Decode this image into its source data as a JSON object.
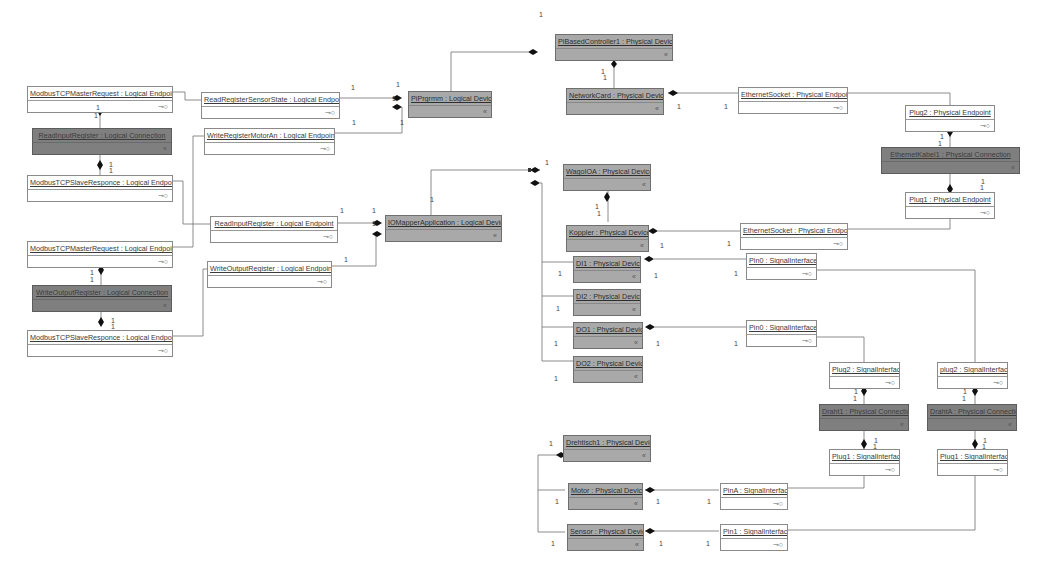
{
  "diagram": {
    "nodes": [
      {
        "id": "mtcp_req1",
        "label": "ModbusTCPMasterRequest : Logical Endpoint",
        "kind": "endpoint",
        "port": "⊸○"
      },
      {
        "id": "conn_read",
        "label": "ReadInputRegister : Logical Connection",
        "kind": "connection",
        "port": "«"
      },
      {
        "id": "mtcp_resp1",
        "label": "ModbusTCPSlaveResponce : Logical Endpoint",
        "kind": "endpoint",
        "port": "⊸○"
      },
      {
        "id": "mtcp_req2",
        "label": "ModbusTCPMasterRequest : Logical Endpoint",
        "kind": "endpoint",
        "port": "⊸○"
      },
      {
        "id": "conn_write",
        "label": "WriteOutputRegister : Logical Connection",
        "kind": "connection",
        "port": "«"
      },
      {
        "id": "mtcp_resp2",
        "label": "ModbusTCPSlaveResponce : Logical Endpoint",
        "kind": "endpoint",
        "port": "⊸○"
      },
      {
        "id": "rrss",
        "label": "ReadRegisterSensorState : Logical Endpoint",
        "kind": "endpoint",
        "port": "⊸○"
      },
      {
        "id": "wrma",
        "label": "WriteRegisterMotorAn : Logical Endpoint",
        "kind": "endpoint",
        "port": "⊸○"
      },
      {
        "id": "rir",
        "label": "ReadInputRegister : Logical Endpoint",
        "kind": "endpoint",
        "port": "⊸○"
      },
      {
        "id": "wor",
        "label": "WriteOutputRegister : Logical Endpoint",
        "kind": "endpoint",
        "port": "⊸○"
      },
      {
        "id": "piprog",
        "label": "PiPrgrmm : Logical Device",
        "kind": "device",
        "port": "«"
      },
      {
        "id": "iomapper",
        "label": "IOMapperApplication : Logical Device",
        "kind": "device",
        "port": "«"
      },
      {
        "id": "pibased",
        "label": "PiBasedController1 : Physical Device",
        "kind": "device",
        "port": "«"
      },
      {
        "id": "netcard",
        "label": "NetworkCard : Physical Device",
        "kind": "device",
        "port": "«"
      },
      {
        "id": "ethsock1",
        "label": "EthernetSocket : Physical Endpoint",
        "kind": "endpoint",
        "port": "⊸○"
      },
      {
        "id": "plug2pe",
        "label": "Plug2 : Physical Endpoint",
        "kind": "endpoint",
        "port": "⊸○"
      },
      {
        "id": "ethkabel",
        "label": "EthernetKabel1 : Physical Connection",
        "kind": "connection",
        "port": "«"
      },
      {
        "id": "plug1pe",
        "label": "Plug1 : Physical Endpoint",
        "kind": "endpoint",
        "port": "⊸○"
      },
      {
        "id": "wago",
        "label": "WagoIOA : Physical Device",
        "kind": "device",
        "port": "«"
      },
      {
        "id": "koppler",
        "label": "Koppler : Physical Device",
        "kind": "device",
        "port": "«"
      },
      {
        "id": "ethsock2",
        "label": "EthernetSocket : Physical Endpoint",
        "kind": "endpoint",
        "port": "⊸○"
      },
      {
        "id": "di1",
        "label": "DI1 : Physical Device",
        "kind": "device",
        "port": "«"
      },
      {
        "id": "di2",
        "label": "DI2 : Physical Device",
        "kind": "device",
        "port": "«"
      },
      {
        "id": "do1",
        "label": "DO1 : Physical Device",
        "kind": "device",
        "port": "«"
      },
      {
        "id": "do2",
        "label": "DO2 : Physical Device",
        "kind": "device",
        "port": "«"
      },
      {
        "id": "pin0a",
        "label": "Pin0 : SignalInterface",
        "kind": "endpoint",
        "port": "⊸○"
      },
      {
        "id": "pin0b",
        "label": "Pin0 : SignalInterface",
        "kind": "endpoint",
        "port": "⊸○"
      },
      {
        "id": "plug2si_a",
        "label": "Plug2 : SignalInterface",
        "kind": "endpoint",
        "port": "⊸○"
      },
      {
        "id": "draht1",
        "label": "Draht1 : Physical Connection",
        "kind": "connection",
        "port": "«"
      },
      {
        "id": "plug1si_a",
        "label": "Plug1 : SignalInterface",
        "kind": "endpoint",
        "port": "⊸○"
      },
      {
        "id": "plug2si_b",
        "label": "plug2 : SignalInterface",
        "kind": "endpoint",
        "port": "⊸○"
      },
      {
        "id": "drahtA",
        "label": "DrahtA : Physical Connection",
        "kind": "connection",
        "port": "«"
      },
      {
        "id": "plug1si_b",
        "label": "Plug1 : SignalInterface",
        "kind": "endpoint",
        "port": "⊸○"
      },
      {
        "id": "drehtisch",
        "label": "Drehtisch1 : Physical Device",
        "kind": "device",
        "port": "«"
      },
      {
        "id": "motor",
        "label": "Motor : Physical Device",
        "kind": "device",
        "port": "«"
      },
      {
        "id": "sensor",
        "label": "Sensor : Physical Device",
        "kind": "device",
        "port": "«"
      },
      {
        "id": "pinA",
        "label": "PinA : SignalInterface",
        "kind": "endpoint",
        "port": "⊸○"
      },
      {
        "id": "pin1",
        "label": "Pin1 : SignalInterface",
        "kind": "endpoint",
        "port": "⊸○"
      }
    ],
    "multiplicities": [
      {
        "text": "1",
        "x": 96,
        "y": 104
      },
      {
        "text": "1",
        "x": 94,
        "y": 112
      },
      {
        "text": "1",
        "x": 109,
        "y": 161
      },
      {
        "text": "1",
        "x": 109,
        "y": 167
      },
      {
        "text": "1",
        "x": 90,
        "y": 269
      },
      {
        "text": "1",
        "x": 90,
        "y": 276
      },
      {
        "text": "1",
        "x": 111,
        "y": 317
      },
      {
        "text": "1",
        "x": 111,
        "y": 323
      },
      {
        "text": "1",
        "x": 351,
        "y": 84
      },
      {
        "text": "1",
        "x": 396,
        "y": 81
      },
      {
        "text": "1",
        "x": 392,
        "y": 95
      },
      {
        "text": "1",
        "x": 352,
        "y": 119
      },
      {
        "text": "1",
        "x": 400,
        "y": 119
      },
      {
        "text": "1",
        "x": 539,
        "y": 11
      },
      {
        "text": "1",
        "x": 601,
        "y": 68
      },
      {
        "text": "1",
        "x": 603,
        "y": 74
      },
      {
        "text": "1",
        "x": 677,
        "y": 103
      },
      {
        "text": "1",
        "x": 724,
        "y": 103
      },
      {
        "text": "1",
        "x": 940,
        "y": 133
      },
      {
        "text": "1",
        "x": 938,
        "y": 140
      },
      {
        "text": "1",
        "x": 981,
        "y": 178
      },
      {
        "text": "1",
        "x": 980,
        "y": 184
      },
      {
        "text": "1",
        "x": 340,
        "y": 207
      },
      {
        "text": "1",
        "x": 372,
        "y": 207
      },
      {
        "text": "1",
        "x": 372,
        "y": 220
      },
      {
        "text": "1",
        "x": 344,
        "y": 256
      },
      {
        "text": "1",
        "x": 430,
        "y": 196
      },
      {
        "text": "1",
        "x": 545,
        "y": 159
      },
      {
        "text": "1",
        "x": 595,
        "y": 203
      },
      {
        "text": "1",
        "x": 597,
        "y": 210
      },
      {
        "text": "1",
        "x": 660,
        "y": 242
      },
      {
        "text": "1",
        "x": 727,
        "y": 240
      },
      {
        "text": "1",
        "x": 558,
        "y": 270
      },
      {
        "text": "1",
        "x": 654,
        "y": 272
      },
      {
        "text": "1",
        "x": 734,
        "y": 270
      },
      {
        "text": "1",
        "x": 556,
        "y": 305
      },
      {
        "text": "1",
        "x": 554,
        "y": 340
      },
      {
        "text": "1",
        "x": 656,
        "y": 340
      },
      {
        "text": "1",
        "x": 734,
        "y": 340
      },
      {
        "text": "1",
        "x": 554,
        "y": 375
      },
      {
        "text": "1",
        "x": 854,
        "y": 388
      },
      {
        "text": "1",
        "x": 853,
        "y": 395
      },
      {
        "text": "1",
        "x": 874,
        "y": 437
      },
      {
        "text": "1",
        "x": 873,
        "y": 443
      },
      {
        "text": "1",
        "x": 963,
        "y": 388
      },
      {
        "text": "1",
        "x": 962,
        "y": 395
      },
      {
        "text": "1",
        "x": 983,
        "y": 437
      },
      {
        "text": "1",
        "x": 982,
        "y": 443
      },
      {
        "text": "1",
        "x": 549,
        "y": 440
      },
      {
        "text": "1",
        "x": 555,
        "y": 498
      },
      {
        "text": "1",
        "x": 656,
        "y": 498
      },
      {
        "text": "1",
        "x": 707,
        "y": 498
      },
      {
        "text": "1",
        "x": 551,
        "y": 540
      },
      {
        "text": "1",
        "x": 659,
        "y": 540
      },
      {
        "text": "1",
        "x": 706,
        "y": 540
      }
    ]
  }
}
